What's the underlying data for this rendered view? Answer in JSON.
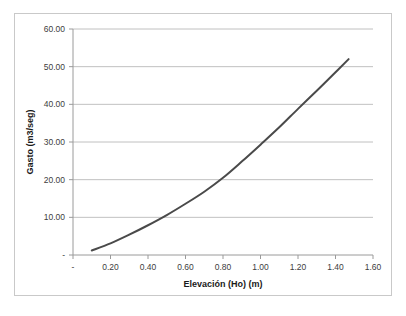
{
  "chart_data": {
    "type": "line",
    "title": "",
    "xlabel": "Elevación (Ho) (m)",
    "ylabel": "Gasto (m3/seg)",
    "xlim": [
      0.0,
      1.6
    ],
    "ylim": [
      0.0,
      60.0
    ],
    "grid": "horizontal",
    "legend": "none",
    "x_tick_labels": [
      "-",
      "0.20",
      "0.40",
      "0.60",
      "0.80",
      "1.00",
      "1.20",
      "1.40",
      "1.60"
    ],
    "x_tick_values": [
      0.0,
      0.2,
      0.4,
      0.6,
      0.8,
      1.0,
      1.2,
      1.4,
      1.6
    ],
    "y_tick_labels": [
      "-",
      "10.00",
      "20.00",
      "30.00",
      "40.00",
      "50.00",
      "60.00"
    ],
    "y_tick_values": [
      0,
      10,
      20,
      30,
      40,
      50,
      60
    ],
    "series": [
      {
        "name": "Gasto vs Elevación",
        "color": "#4a4a4a",
        "x": [
          0.1,
          0.2,
          0.3,
          0.4,
          0.5,
          0.6,
          0.7,
          0.8,
          0.9,
          1.0,
          1.1,
          1.2,
          1.3,
          1.4,
          1.47
        ],
        "values": [
          1.2,
          3.1,
          5.4,
          7.9,
          10.6,
          13.6,
          16.8,
          20.5,
          24.8,
          29.3,
          33.9,
          38.8,
          43.6,
          48.5,
          52.0
        ]
      }
    ]
  },
  "figure": {
    "border_color": "#c9c9c9",
    "background": "#ffffff",
    "plot_background": "#ffffff"
  }
}
